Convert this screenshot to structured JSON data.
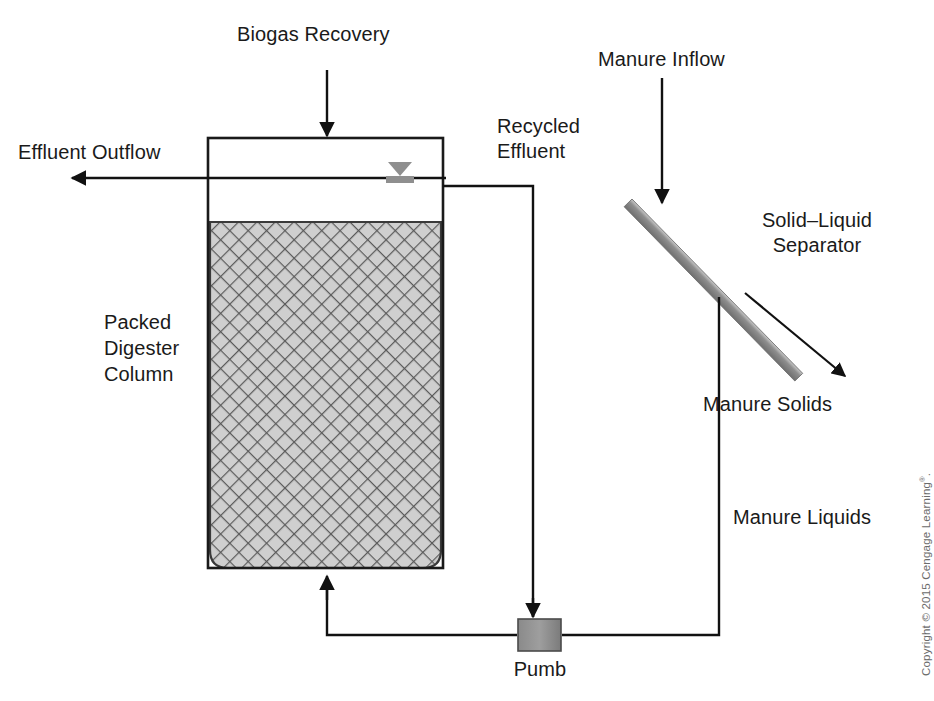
{
  "figure": {
    "type": "process-flow-diagram",
    "background_color": "#ffffff",
    "line_color": "#1a1a1a",
    "fill_gray": "#9a9a9a",
    "hatch_gray": "#b8b8b8"
  },
  "labels": {
    "biogas_recovery": "Biogas Recovery",
    "effluent_outflow": "Effluent Outflow",
    "recycled_effluent_line1": "Recycled",
    "recycled_effluent_line2": "Effluent",
    "manure_inflow": "Manure Inflow",
    "solid_liquid_separator_line1": "Solid–Liquid",
    "solid_liquid_separator_line2": "Separator",
    "manure_solids": "Manure Solids",
    "manure_liquids": "Manure Liquids",
    "packed_digester_column_line1": "Packed",
    "packed_digester_column_line2": "Digester",
    "packed_digester_column_line3": "Column",
    "pump": "Pumb"
  },
  "components": {
    "digester_tank": {
      "name": "Packed Digester Column",
      "x": 208,
      "y": 138,
      "width": 235,
      "height": 430
    },
    "packed_bed": {
      "name": "packed media bed",
      "x": 210,
      "y": 222,
      "width": 231,
      "height": 346,
      "pattern": "diagonal-crosshatch"
    },
    "water_level_indicator": {
      "name": "water level symbol",
      "x": 400,
      "y": 178
    },
    "separator_bar": {
      "name": "inclined screen separator",
      "x1": 637,
      "y1": 208,
      "x2": 806,
      "y2": 381,
      "thickness": 11
    },
    "pump_box": {
      "name": "pump",
      "x": 518,
      "y": 619,
      "width": 43,
      "height": 32
    }
  },
  "flows": [
    {
      "name": "biogas-recovery-arrow",
      "direction": "down-into-tank-top",
      "from": [
        327,
        70
      ],
      "to": [
        327,
        138
      ]
    },
    {
      "name": "effluent-outflow-arrow",
      "direction": "left-out-of-tank",
      "from": [
        443,
        178
      ],
      "to": [
        70,
        178
      ]
    },
    {
      "name": "manure-inflow-arrow",
      "direction": "down-onto-separator",
      "from": [
        662,
        78
      ],
      "to": [
        662,
        205
      ]
    },
    {
      "name": "manure-solids-leader",
      "direction": "down-right",
      "from": [
        745,
        293
      ],
      "to": [
        845,
        376
      ]
    },
    {
      "name": "recycled-effluent-path",
      "direction": "tank-right-down-to-pump",
      "points": [
        [
          443,
          186
        ],
        [
          533,
          186
        ],
        [
          533,
          619
        ]
      ]
    },
    {
      "name": "manure-liquids-path",
      "direction": "separator-down-left-to-pump",
      "points": [
        [
          719,
          297
        ],
        [
          719,
          635
        ],
        [
          561,
          635
        ]
      ]
    },
    {
      "name": "pump-discharge-path",
      "direction": "pump-left-up-into-tank-bottom",
      "points": [
        [
          518,
          635
        ],
        [
          327,
          635
        ],
        [
          327,
          575
        ]
      ]
    }
  ],
  "copyright": {
    "prefix": "Copyright © 2015 Cengage Learning",
    "registered_mark": "®",
    "suffix": "."
  }
}
